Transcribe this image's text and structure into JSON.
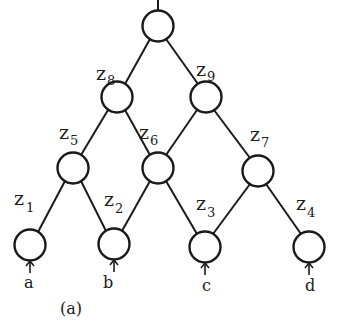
{
  "diagram": {
    "caption": "(a)",
    "type": "binary tree network",
    "nodes": [
      {
        "id": "root",
        "label": "",
        "cx": 158,
        "cy": 26
      },
      {
        "id": "z8",
        "label": "z",
        "sub": "8",
        "cx": 117,
        "cy": 97
      },
      {
        "id": "z9",
        "label": "z",
        "sub": "9",
        "cx": 206,
        "cy": 97
      },
      {
        "id": "z5",
        "label": "z",
        "sub": "5",
        "cx": 73,
        "cy": 168
      },
      {
        "id": "z6",
        "label": "z",
        "sub": "6",
        "cx": 158,
        "cy": 168
      },
      {
        "id": "z7",
        "label": "z",
        "sub": "7",
        "cx": 258,
        "cy": 171
      },
      {
        "id": "z1",
        "label": "z",
        "sub": "1",
        "cx": 30,
        "cy": 245
      },
      {
        "id": "z2",
        "label": "z",
        "sub": "2",
        "cx": 114,
        "cy": 244
      },
      {
        "id": "z3",
        "label": "z",
        "sub": "3",
        "cx": 205,
        "cy": 247
      },
      {
        "id": "z4",
        "label": "z",
        "sub": "4",
        "cx": 309,
        "cy": 247
      }
    ],
    "edges": [
      [
        "root",
        "z8"
      ],
      [
        "root",
        "z9"
      ],
      [
        "z8",
        "z5"
      ],
      [
        "z8",
        "z6"
      ],
      [
        "z9",
        "z6"
      ],
      [
        "z9",
        "z7"
      ],
      [
        "z5",
        "z1"
      ],
      [
        "z5",
        "z2"
      ],
      [
        "z6",
        "z2"
      ],
      [
        "z6",
        "z3"
      ],
      [
        "z7",
        "z3"
      ],
      [
        "z7",
        "z4"
      ]
    ],
    "inputs": [
      {
        "label": "a",
        "node": "z1"
      },
      {
        "label": "b",
        "node": "z2"
      },
      {
        "label": "c",
        "node": "z3"
      },
      {
        "label": "d",
        "node": "z4"
      }
    ],
    "labels": {
      "z1": {
        "z": "z",
        "sub": "1"
      },
      "z2": {
        "z": "z",
        "sub": "2"
      },
      "z3": {
        "z": "z",
        "sub": "3"
      },
      "z4": {
        "z": "z",
        "sub": "4"
      },
      "z5": {
        "z": "z",
        "sub": "5"
      },
      "z6": {
        "z": "z",
        "sub": "6"
      },
      "z7": {
        "z": "z",
        "sub": "7"
      },
      "z8": {
        "z": "z",
        "sub": "8"
      },
      "z9": {
        "z": "z",
        "sub": "9"
      }
    },
    "input_labels": {
      "a": "a",
      "b": "b",
      "c": "c",
      "d": "d"
    }
  }
}
